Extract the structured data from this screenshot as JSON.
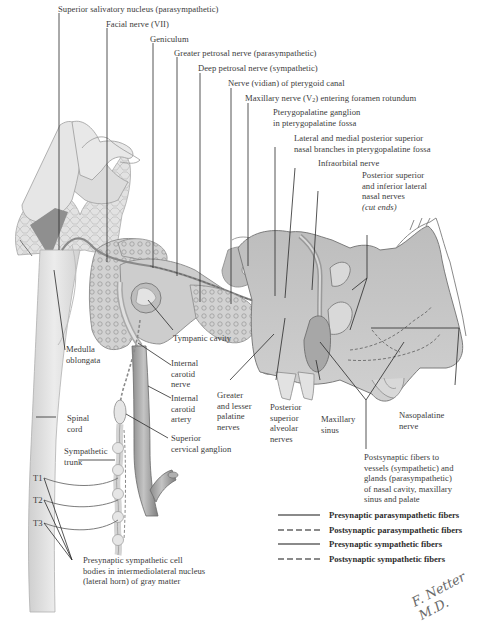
{
  "figure": {
    "style": "grayscale anatomical illustration",
    "colors": {
      "background": "#ffffff",
      "label_text": "#3b3b3b",
      "leader_line": "#2a2a2a",
      "bone_fill": "#d6d6d6",
      "soft_tissue_fill": "#e4e4e4",
      "shadow_fill": "#9a9a9a",
      "fiber_line": "#8a8a8a"
    }
  },
  "labels": {
    "superior_salivatory_nucleus": "Superior salivatory nucleus (parasympathetic)",
    "facial_nerve": "Facial nerve (VII)",
    "geniculum": "Geniculum",
    "greater_petrosal_nerve": "Greater petrosal nerve (parasympathetic)",
    "deep_petrosal_nerve": "Deep petrosal nerve (sympathetic)",
    "nerve_pterygoid_canal": "Nerve (vidian) of pterygoid canal",
    "maxillary_nerve_pre": "Maxillary nerve (V",
    "maxillary_nerve_sub": "2",
    "maxillary_nerve_post": ") entering foramen rotundum",
    "pterygopalatine_ganglion_1": "Pterygopalatine ganglion",
    "pterygopalatine_ganglion_2": "in pterygopalatine fossa",
    "lateral_medial_branches_1": "Lateral and medial posterior superior",
    "lateral_medial_branches_2": "nasal branches in pterygopalatine fossa",
    "infraorbital_nerve": "Infraorbital nerve",
    "post_sup_inf_lateral_1": "Posterior superior",
    "post_sup_inf_lateral_2": "and inferior lateral",
    "post_sup_inf_lateral_3": "nasal nerves",
    "post_sup_inf_lateral_4": "(cut ends)",
    "tympanic_cavity": "Tympanic cavity",
    "medulla_1": "Medulla",
    "medulla_2": "oblongata",
    "internal_carotid_nerve_1": "Internal",
    "internal_carotid_nerve_2": "carotid",
    "internal_carotid_nerve_3": "nerve",
    "internal_carotid_artery_1": "Internal",
    "internal_carotid_artery_2": "carotid",
    "internal_carotid_artery_3": "artery",
    "greater_lesser_palatine_1": "Greater",
    "greater_lesser_palatine_2": "and lesser",
    "greater_lesser_palatine_3": "palatine",
    "greater_lesser_palatine_4": "nerves",
    "post_sup_alveolar_1": "Posterior",
    "post_sup_alveolar_2": "superior",
    "post_sup_alveolar_3": "alveolar",
    "post_sup_alveolar_4": "nerves",
    "maxillary_sinus_1": "Maxillary",
    "maxillary_sinus_2": "sinus",
    "nasopalatine_1": "Nasopalatine",
    "nasopalatine_2": "nerve",
    "spinal_cord_1": "Spinal",
    "spinal_cord_2": "cord",
    "superior_cervical_ganglion_1": "Superior",
    "superior_cervical_ganglion_2": "cervical ganglion",
    "sympathetic_trunk_1": "Sympathetic",
    "sympathetic_trunk_2": "trunk",
    "t1": "T1",
    "t2": "T2",
    "t3": "T3",
    "postsynaptic_fibers_1": "Postsynaptic fibers to",
    "postsynaptic_fibers_2": "vessels (sympathetic) and",
    "postsynaptic_fibers_3": "glands (parasympathetic)",
    "postsynaptic_fibers_4": "of  nasal cavity, maxillary",
    "postsynaptic_fibers_5": "sinus and palate",
    "presynaptic_cell_bodies_1": "Presynaptic sympathetic cell",
    "presynaptic_cell_bodies_2": "bodies in intermediolateral nucleus",
    "presynaptic_cell_bodies_3": "(lateral horn) of gray matter"
  },
  "legend": {
    "items": [
      {
        "label": "Presynaptic parasympathetic fibers",
        "style": "solid"
      },
      {
        "label": "Postsynaptic parasympathetic fibers",
        "style": "dashed"
      },
      {
        "label": "Presynaptic sympathetic fibers",
        "style": "solid"
      },
      {
        "label": "Postsynaptic sympathetic fibers",
        "style": "dashed"
      }
    ]
  },
  "signature": "F. Netter M.D."
}
